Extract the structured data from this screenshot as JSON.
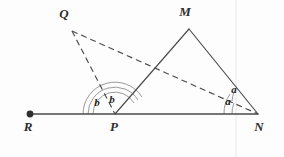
{
  "figure": {
    "background_color": "#fdfdfd",
    "line_color": "#4a4a4a",
    "arc_color": "#8d8d8d",
    "label_color": "#2e2e2e",
    "width": 284,
    "height": 157
  },
  "points": {
    "R": {
      "label": "R",
      "x": 30,
      "y": 114,
      "label_x": 28,
      "label_y": 131,
      "marker": "filled-dot"
    },
    "P": {
      "label": "P",
      "x": 115,
      "y": 114,
      "label_x": 114,
      "label_y": 131,
      "marker": "none"
    },
    "N": {
      "label": "N",
      "x": 258,
      "y": 114,
      "label_x": 259,
      "label_y": 131,
      "marker": "none"
    },
    "Q": {
      "label": "Q",
      "x": 72,
      "y": 31,
      "label_x": 64,
      "label_y": 18,
      "marker": "none"
    },
    "M": {
      "label": "M",
      "x": 189,
      "y": 29,
      "label_x": 185,
      "label_y": 16,
      "marker": "none"
    }
  },
  "segments": [
    {
      "name": "base-line-RN",
      "from": "R",
      "to": "N",
      "style": "solid"
    },
    {
      "name": "segment-PM",
      "from": "P",
      "to": "M",
      "style": "solid"
    },
    {
      "name": "segment-MN",
      "from": "M",
      "to": "N",
      "style": "solid"
    },
    {
      "name": "segment-QP",
      "from": "Q",
      "to": "P",
      "style": "dashed"
    },
    {
      "name": "segment-QN",
      "from": "Q",
      "to": "N",
      "style": "dashed"
    }
  ],
  "angles": [
    {
      "name": "angle-b-left",
      "vertex": "P",
      "label": "b",
      "label_x": 97,
      "label_y": 106,
      "description": "angle between ray PR and ray PQ"
    },
    {
      "name": "angle-b-right",
      "vertex": "P",
      "label": "b",
      "label_x": 112,
      "label_y": 103,
      "description": "angle between ray PQ and ray PM"
    },
    {
      "name": "angle-a-upper",
      "vertex": "N",
      "label": "a",
      "label_x": 234,
      "label_y": 93,
      "description": "angle between ray NQ and ray NM"
    },
    {
      "name": "angle-a-lower",
      "vertex": "N",
      "label": "a",
      "label_x": 228,
      "label_y": 105,
      "description": "angle between ray NR and ray NQ"
    }
  ],
  "arcs": [
    {
      "name": "arc-P-inner",
      "vertex": "P",
      "radius": 22
    },
    {
      "name": "arc-P-outer",
      "vertex": "P",
      "radius": 27
    },
    {
      "name": "arc-P-mid",
      "vertex": "P",
      "radius": 32
    },
    {
      "name": "arc-N-inner",
      "vertex": "N",
      "radius": 26
    },
    {
      "name": "arc-N-outer",
      "vertex": "N",
      "radius": 34
    }
  ]
}
